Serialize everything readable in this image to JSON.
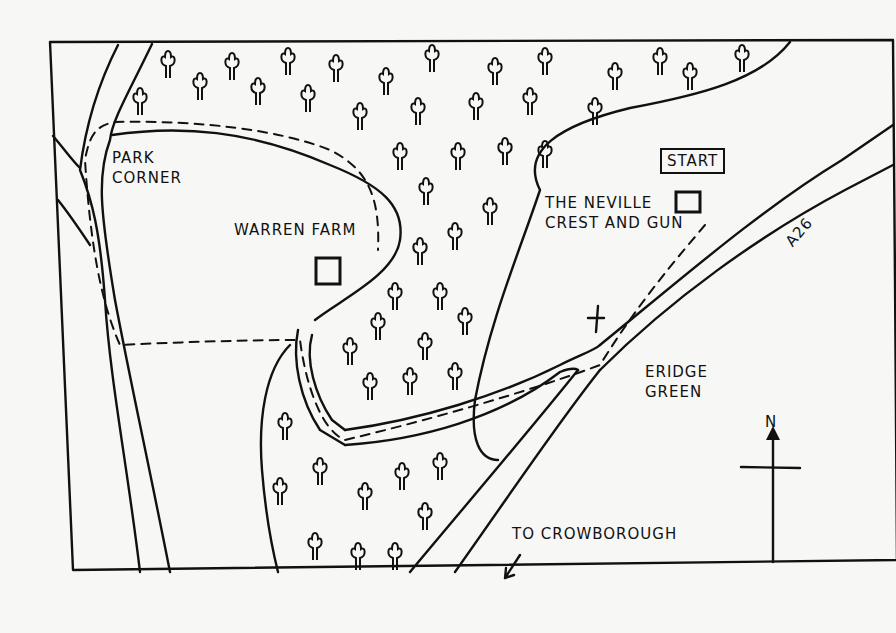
{
  "map": {
    "title": "Walk map: Eridge Green",
    "labels": {
      "park_corner": [
        "PARK",
        "CORNER"
      ],
      "warren_farm": "WARREN FARM",
      "start": "START",
      "pub": [
        "THE NEVILLE",
        "CREST AND GUN"
      ],
      "road": "A26",
      "village": [
        "ERIDGE",
        "GREEN"
      ],
      "to_town": "TO CROWBOROUGH",
      "north": "N"
    },
    "icons": [
      "tree-icon",
      "building-icon",
      "church-cross-icon",
      "north-arrow-icon",
      "direction-arrow-icon"
    ],
    "colors": {
      "ink": "#111111",
      "paper": "#f7f7f5"
    }
  }
}
